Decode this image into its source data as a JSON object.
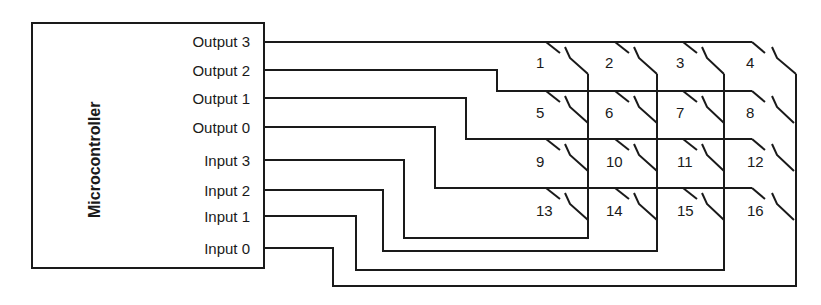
{
  "diagram": {
    "block_label": "Microcontroller",
    "pins": [
      {
        "label": "Output 3",
        "y": 42
      },
      {
        "label": "Output 2",
        "y": 70
      },
      {
        "label": "Output 1",
        "y": 98
      },
      {
        "label": "Output 0",
        "y": 127
      },
      {
        "label": "Input 3",
        "y": 160
      },
      {
        "label": "Input 2",
        "y": 190
      },
      {
        "label": "Input 1",
        "y": 216
      },
      {
        "label": "Input 0",
        "y": 248
      }
    ],
    "switches": [
      "1",
      "2",
      "3",
      "4",
      "5",
      "6",
      "7",
      "8",
      "9",
      "10",
      "11",
      "12",
      "13",
      "14",
      "15",
      "16"
    ],
    "colors": {
      "line": "#1a1a1a",
      "background": "#ffffff"
    }
  }
}
